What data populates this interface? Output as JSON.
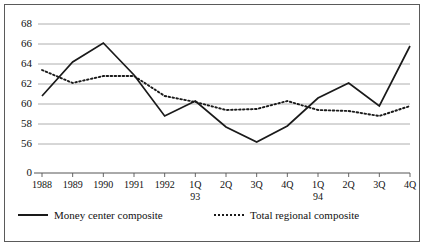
{
  "chart_data": {
    "type": "line",
    "title": "",
    "subtitle": "",
    "xlabel": "",
    "ylabel": "",
    "grid": true,
    "legend_position": "bottom",
    "categories": [
      "1988",
      "1989",
      "1990",
      "1991",
      "1992",
      "1Q",
      "2Q",
      "3Q",
      "4Q",
      "1Q",
      "2Q",
      "3Q",
      "4Q"
    ],
    "category_sublabels": [
      "",
      "",
      "",
      "",
      "",
      "93",
      "",
      "",
      "",
      "94",
      "",
      "",
      ""
    ],
    "ylim": [
      55.0,
      68.6
    ],
    "yticks": [
      68,
      66,
      64,
      62,
      60,
      58,
      56
    ],
    "ytick_labels": [
      "68",
      "66",
      "64",
      "62",
      "60",
      "58",
      "56"
    ],
    "axis_break_label": "0",
    "series": [
      {
        "name": "Money center composite",
        "style": "solid",
        "color": "#1a1a1a",
        "values": [
          60.8,
          64.2,
          66.1,
          62.9,
          58.8,
          60.3,
          57.7,
          56.2,
          57.8,
          60.6,
          62.1,
          59.8,
          65.8
        ]
      },
      {
        "name": "Total regional composite",
        "style": "dotted",
        "color": "#1a1a1a",
        "values": [
          63.4,
          62.1,
          62.8,
          62.8,
          60.8,
          60.2,
          59.4,
          59.5,
          60.3,
          59.4,
          59.3,
          58.8,
          59.8
        ]
      }
    ]
  },
  "legend": {
    "entries": [
      {
        "label": "Money center composite",
        "style": "solid"
      },
      {
        "label": "Total regional composite",
        "style": "dotted"
      }
    ]
  }
}
